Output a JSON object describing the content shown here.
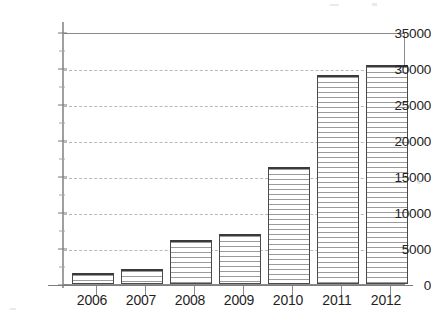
{
  "chart_data": {
    "type": "bar",
    "title": "",
    "subtitle": "",
    "xlabel": "",
    "ylabel": "",
    "categories": [
      "2006",
      "2007",
      "2008",
      "2009",
      "2010",
      "2011",
      "2012"
    ],
    "values": [
      1500,
      2100,
      6200,
      7000,
      16400,
      29300,
      30700
    ],
    "series": [
      {
        "name": "",
        "values": [
          1500,
          2100,
          6200,
          7000,
          16400,
          29300,
          30700
        ]
      }
    ],
    "ylim": [
      0,
      35000
    ],
    "yticks": [
      0,
      5000,
      10000,
      15000,
      20000,
      25000,
      30000,
      35000
    ],
    "ytick_labels": [
      "0",
      "5000",
      "10000",
      "15000",
      "20000",
      "25000",
      "30000",
      "35000"
    ],
    "xtick_labels": [
      "2006",
      "2007",
      "2008",
      "2009",
      "2010",
      "2011",
      "2012"
    ],
    "grid": true,
    "grid_axis": "y",
    "grid_style": "dashed",
    "legend": null,
    "legend_position": "none",
    "annotations": [],
    "bar_fill": "horizontal-hatch",
    "colors": {
      "bar_edge": "#4a4a4a",
      "bar_hatch": "#9a9a9a",
      "bar_face": "#ffffff",
      "gridline": "#b9b9b9",
      "axis": "#7d7d7d",
      "text": "#1f1f1f",
      "background": "#ffffff"
    }
  }
}
